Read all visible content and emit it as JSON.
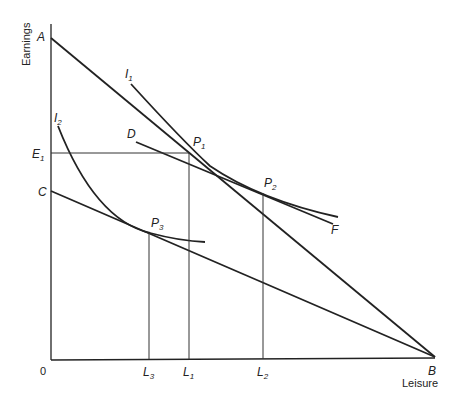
{
  "diagram": {
    "axes": {
      "y_label": "Earnings",
      "x_label": "Leisure",
      "origin": "0"
    },
    "points": {
      "A": "A",
      "B": "B",
      "C": "C",
      "D": "D",
      "E1": "E",
      "E1_sub": "1",
      "F": "F",
      "P1": "P",
      "P1_sub": "1",
      "P2": "P",
      "P2_sub": "2",
      "P3": "P",
      "P3_sub": "3"
    },
    "curves": {
      "I1": "I",
      "I1_sub": "1",
      "I2": "I",
      "I2_sub": "2"
    },
    "ticks": {
      "L3": "L",
      "L3_sub": "3",
      "L1": "L",
      "L1_sub": "1",
      "L2": "L",
      "L2_sub": "2"
    }
  }
}
